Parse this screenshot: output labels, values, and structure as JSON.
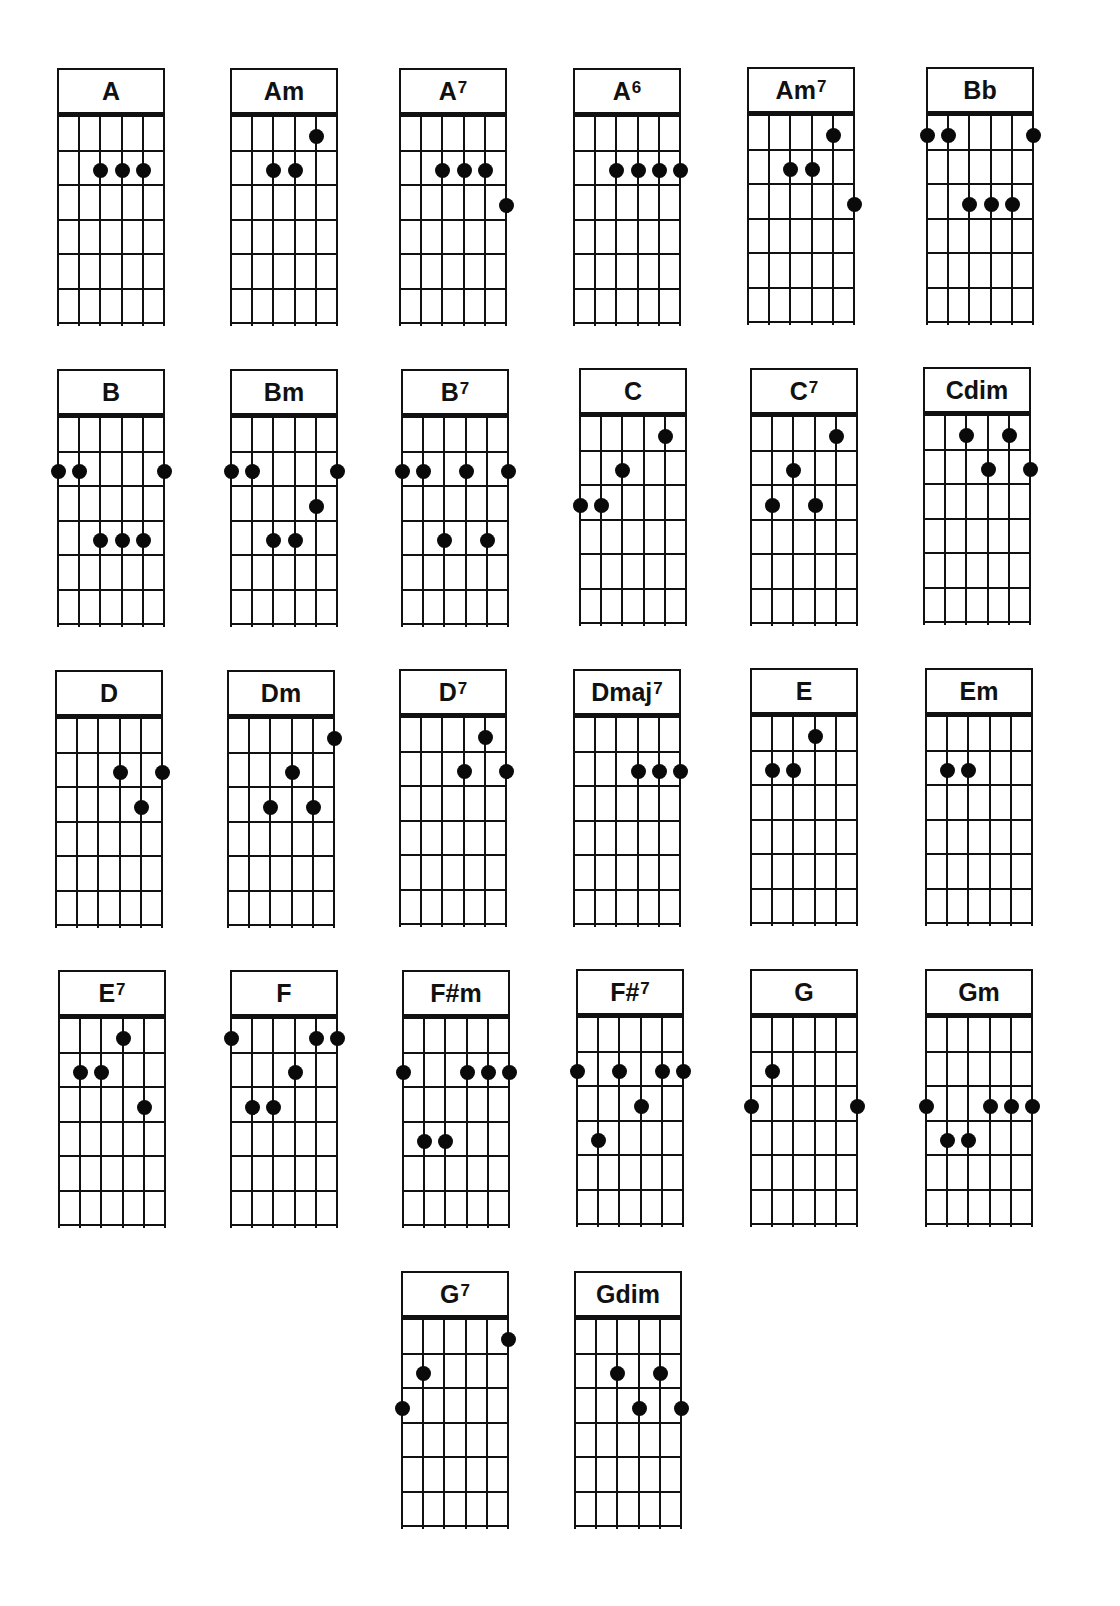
{
  "chart_data": {
    "type": "chord-diagram",
    "title": "",
    "instrument": "guitar",
    "strings": 6,
    "frets_shown": 6,
    "string_order": "left-to-right (1 = leftmost)",
    "chords": [
      {
        "name": "A",
        "base": "A",
        "sup": "",
        "dots": [
          [
            3,
            2
          ],
          [
            4,
            2
          ],
          [
            5,
            2
          ]
        ]
      },
      {
        "name": "Am",
        "base": "Am",
        "sup": "",
        "dots": [
          [
            5,
            1
          ],
          [
            3,
            2
          ],
          [
            4,
            2
          ]
        ]
      },
      {
        "name": "A7",
        "base": "A",
        "sup": "7",
        "dots": [
          [
            3,
            2
          ],
          [
            4,
            2
          ],
          [
            5,
            2
          ],
          [
            6,
            3
          ]
        ]
      },
      {
        "name": "A6",
        "base": "A",
        "sup": "6",
        "dots": [
          [
            3,
            2
          ],
          [
            4,
            2
          ],
          [
            5,
            2
          ],
          [
            6,
            2
          ]
        ]
      },
      {
        "name": "Am7",
        "base": "Am",
        "sup": "7",
        "dots": [
          [
            5,
            1
          ],
          [
            3,
            2
          ],
          [
            4,
            2
          ],
          [
            6,
            3
          ]
        ]
      },
      {
        "name": "Bb",
        "base": "Bb",
        "sup": "",
        "dots": [
          [
            1,
            1
          ],
          [
            2,
            1
          ],
          [
            6,
            1
          ],
          [
            3,
            3
          ],
          [
            4,
            3
          ],
          [
            5,
            3
          ]
        ]
      },
      {
        "name": "B",
        "base": "B",
        "sup": "",
        "dots": [
          [
            1,
            2
          ],
          [
            2,
            2
          ],
          [
            6,
            2
          ],
          [
            3,
            4
          ],
          [
            4,
            4
          ],
          [
            5,
            4
          ]
        ]
      },
      {
        "name": "Bm",
        "base": "Bm",
        "sup": "",
        "dots": [
          [
            1,
            2
          ],
          [
            2,
            2
          ],
          [
            6,
            2
          ],
          [
            5,
            3
          ],
          [
            3,
            4
          ],
          [
            4,
            4
          ]
        ]
      },
      {
        "name": "B7",
        "base": "B",
        "sup": "7",
        "dots": [
          [
            1,
            2
          ],
          [
            2,
            2
          ],
          [
            4,
            2
          ],
          [
            6,
            2
          ],
          [
            3,
            4
          ],
          [
            5,
            4
          ]
        ]
      },
      {
        "name": "C",
        "base": "C",
        "sup": "",
        "dots": [
          [
            5,
            1
          ],
          [
            3,
            2
          ],
          [
            1,
            3
          ],
          [
            2,
            3
          ]
        ]
      },
      {
        "name": "C7",
        "base": "C",
        "sup": "7",
        "dots": [
          [
            5,
            1
          ],
          [
            3,
            2
          ],
          [
            2,
            3
          ],
          [
            4,
            3
          ]
        ]
      },
      {
        "name": "Cdim",
        "base": "Cdim",
        "sup": "",
        "dots": [
          [
            3,
            1
          ],
          [
            5,
            1
          ],
          [
            4,
            2
          ],
          [
            6,
            2
          ]
        ]
      },
      {
        "name": "D",
        "base": "D",
        "sup": "",
        "dots": [
          [
            4,
            2
          ],
          [
            6,
            2
          ],
          [
            5,
            3
          ]
        ]
      },
      {
        "name": "Dm",
        "base": "Dm",
        "sup": "",
        "dots": [
          [
            6,
            1
          ],
          [
            4,
            2
          ],
          [
            3,
            3
          ],
          [
            5,
            3
          ]
        ]
      },
      {
        "name": "D7",
        "base": "D",
        "sup": "7",
        "dots": [
          [
            5,
            1
          ],
          [
            4,
            2
          ],
          [
            6,
            2
          ]
        ]
      },
      {
        "name": "Dmaj7",
        "base": "Dmaj",
        "sup": "7",
        "dots": [
          [
            4,
            2
          ],
          [
            5,
            2
          ],
          [
            6,
            2
          ]
        ]
      },
      {
        "name": "E",
        "base": "E",
        "sup": "",
        "dots": [
          [
            4,
            1
          ],
          [
            2,
            2
          ],
          [
            3,
            2
          ]
        ]
      },
      {
        "name": "Em",
        "base": "Em",
        "sup": "",
        "dots": [
          [
            2,
            2
          ],
          [
            3,
            2
          ]
        ]
      },
      {
        "name": "E7",
        "base": "E",
        "sup": "7",
        "dots": [
          [
            4,
            1
          ],
          [
            2,
            2
          ],
          [
            3,
            2
          ],
          [
            5,
            3
          ]
        ]
      },
      {
        "name": "F",
        "base": "F",
        "sup": "",
        "dots": [
          [
            1,
            1
          ],
          [
            5,
            1
          ],
          [
            6,
            1
          ],
          [
            4,
            2
          ],
          [
            2,
            3
          ],
          [
            3,
            3
          ]
        ]
      },
      {
        "name": "F#m",
        "base": "F#m",
        "sup": "",
        "dots": [
          [
            1,
            2
          ],
          [
            4,
            2
          ],
          [
            5,
            2
          ],
          [
            6,
            2
          ],
          [
            2,
            4
          ],
          [
            3,
            4
          ]
        ]
      },
      {
        "name": "F#7",
        "base": "F#",
        "sup": "7",
        "dots": [
          [
            1,
            2
          ],
          [
            3,
            2
          ],
          [
            5,
            2
          ],
          [
            6,
            2
          ],
          [
            4,
            3
          ],
          [
            2,
            4
          ]
        ]
      },
      {
        "name": "G",
        "base": "G",
        "sup": "",
        "dots": [
          [
            2,
            2
          ],
          [
            1,
            3
          ],
          [
            6,
            3
          ]
        ]
      },
      {
        "name": "Gm",
        "base": "Gm",
        "sup": "",
        "dots": [
          [
            1,
            3
          ],
          [
            4,
            3
          ],
          [
            5,
            3
          ],
          [
            6,
            3
          ],
          [
            2,
            4
          ],
          [
            3,
            4
          ]
        ]
      },
      {
        "name": "G7",
        "base": "G",
        "sup": "7",
        "dots": [
          [
            6,
            1
          ],
          [
            2,
            2
          ],
          [
            1,
            3
          ]
        ]
      },
      {
        "name": "Gdim",
        "base": "Gdim",
        "sup": "",
        "dots": [
          [
            3,
            2
          ],
          [
            5,
            2
          ],
          [
            4,
            3
          ],
          [
            6,
            3
          ]
        ]
      }
    ],
    "layout": {
      "positions": [
        [
          57,
          68
        ],
        [
          230,
          68
        ],
        [
          399,
          68
        ],
        [
          573,
          68
        ],
        [
          747,
          67
        ],
        [
          926,
          67
        ],
        [
          57,
          369
        ],
        [
          230,
          369
        ],
        [
          401,
          369
        ],
        [
          579,
          368
        ],
        [
          750,
          368
        ],
        [
          923,
          367
        ],
        [
          55,
          670
        ],
        [
          227,
          670
        ],
        [
          399,
          669
        ],
        [
          573,
          669
        ],
        [
          750,
          668
        ],
        [
          925,
          668
        ],
        [
          58,
          970
        ],
        [
          230,
          970
        ],
        [
          402,
          970
        ],
        [
          576,
          969
        ],
        [
          750,
          969
        ],
        [
          925,
          969
        ],
        [
          401,
          1271
        ],
        [
          574,
          1271
        ]
      ]
    }
  }
}
